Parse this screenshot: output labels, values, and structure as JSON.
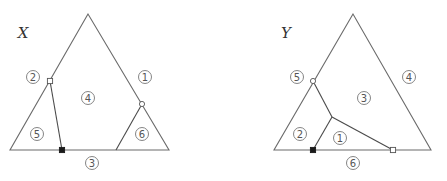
{
  "diagrams": [
    {
      "id": "X",
      "title": "X",
      "title_pos": [
        23,
        33
      ],
      "outer_triangle": [
        [
          88,
          14
        ],
        [
          10,
          150
        ],
        [
          169,
          150
        ]
      ],
      "inner_lines": [
        {
          "from": [
            50,
            81
          ],
          "to": [
            62,
            150
          ]
        },
        {
          "from": [
            142,
            104
          ],
          "to": [
            116,
            150
          ]
        }
      ],
      "markers": [
        {
          "type": "open-square",
          "at": [
            50,
            81
          ]
        },
        {
          "type": "filled-square",
          "at": [
            62,
            150
          ]
        },
        {
          "type": "open-circle",
          "at": [
            142,
            104
          ]
        }
      ],
      "labels": [
        {
          "text": "2",
          "at": [
            33,
            77
          ]
        },
        {
          "text": "1",
          "at": [
            145,
            77
          ]
        },
        {
          "text": "4",
          "at": [
            88,
            98
          ]
        },
        {
          "text": "5",
          "at": [
            37,
            134
          ]
        },
        {
          "text": "6",
          "at": [
            142,
            134
          ]
        },
        {
          "text": "3",
          "at": [
            92,
            163
          ]
        }
      ]
    },
    {
      "id": "Y",
      "title": "Y",
      "title_pos": [
        286,
        33
      ],
      "outer_triangle": [
        [
          353,
          14
        ],
        [
          274,
          150
        ],
        [
          431,
          150
        ]
      ],
      "inner_lines": [
        {
          "from": [
            313,
            81
          ],
          "to": [
            332,
            117
          ]
        },
        {
          "from": [
            332,
            117
          ],
          "to": [
            313,
            150
          ]
        },
        {
          "from": [
            332,
            117
          ],
          "to": [
            393,
            150
          ]
        }
      ],
      "markers": [
        {
          "type": "open-circle",
          "at": [
            313,
            81
          ]
        },
        {
          "type": "filled-square",
          "at": [
            313,
            150
          ]
        },
        {
          "type": "open-square",
          "at": [
            393,
            150
          ]
        }
      ],
      "labels": [
        {
          "text": "5",
          "at": [
            297,
            77
          ]
        },
        {
          "text": "4",
          "at": [
            409,
            77
          ]
        },
        {
          "text": "3",
          "at": [
            364,
            98
          ]
        },
        {
          "text": "2",
          "at": [
            300,
            134
          ]
        },
        {
          "text": "1",
          "at": [
            340,
            138
          ]
        },
        {
          "text": "6",
          "at": [
            353,
            163
          ]
        }
      ]
    }
  ]
}
